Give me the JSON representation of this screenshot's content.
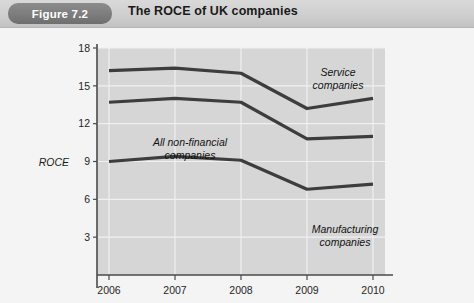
{
  "header": {
    "badge": "Figure 7.2",
    "title": "The ROCE of UK companies"
  },
  "chart_data": {
    "type": "line",
    "title": "The ROCE of UK companies",
    "xlabel": "",
    "ylabel": "ROCE",
    "categories": [
      "2006",
      "2007",
      "2008",
      "2009",
      "2010"
    ],
    "yticks": [
      "3",
      "6",
      "9",
      "12",
      "15",
      "18"
    ],
    "ylim": [
      0,
      18
    ],
    "grid": true,
    "legend": "inline-annotations",
    "series": [
      {
        "name": "Service companies",
        "label_lines": [
          "Service",
          "companies"
        ],
        "values": [
          16.2,
          16.4,
          16.0,
          13.2,
          14.0
        ],
        "color": "#3d3d3d"
      },
      {
        "name": "All non-financial companies",
        "label_lines": [
          "All non-financial",
          "companies"
        ],
        "values": [
          13.7,
          14.0,
          13.7,
          10.8,
          11.0
        ],
        "color": "#3d3d3d"
      },
      {
        "name": "Manufacturing companies",
        "label_lines": [
          "Manufacturing",
          "companies"
        ],
        "values": [
          9.0,
          9.4,
          9.1,
          6.8,
          7.2
        ],
        "color": "#3d3d3d"
      }
    ]
  },
  "colors": {
    "plot_background": "#d6d6d6",
    "grid": "#f0f0f0",
    "axis": "#4a4a4a",
    "line": "#3d3d3d",
    "badge": "#7b7b7b",
    "header": "#cfcfcf"
  }
}
